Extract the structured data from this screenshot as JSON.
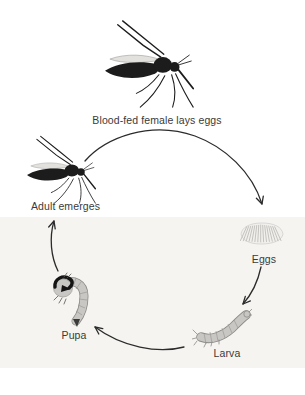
{
  "diagram": {
    "name": "mosquito-life-cycle",
    "stages": [
      {
        "id": "blood-fed-female",
        "label": "Blood-fed female lays eggs"
      },
      {
        "id": "eggs",
        "label": "Eggs"
      },
      {
        "id": "larva",
        "label": "Larva"
      },
      {
        "id": "pupa",
        "label": "Pupa"
      },
      {
        "id": "adult",
        "label": "Adult emerges"
      }
    ],
    "transitions": [
      {
        "from": "blood-fed-female",
        "to": "eggs"
      },
      {
        "from": "eggs",
        "to": "larva"
      },
      {
        "from": "larva",
        "to": "pupa"
      },
      {
        "from": "pupa",
        "to": "adult"
      }
    ]
  },
  "icons": {
    "blood_fed_female": "mosquito-icon",
    "adult": "mosquito-icon",
    "eggs": "egg-raft-icon",
    "larva": "larva-icon",
    "pupa": "pupa-icon",
    "arrows": "curved-arrow-icon"
  },
  "colors": {
    "background": "#ffffff",
    "band": "#f5f4f1",
    "ink": "#1c1c1c",
    "arrow": "#2b2b2b",
    "text": "#3a3a3a",
    "stage_fill": "#c8c7c4",
    "stage_outline": "#8b8a87",
    "egg_fill": "#f1f0ed"
  }
}
